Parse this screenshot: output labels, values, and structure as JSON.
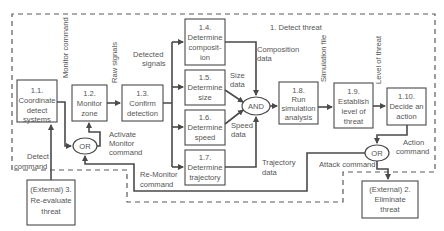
{
  "boundary": {
    "label": "1. Detect threat"
  },
  "processes": [
    {
      "id": "1.1.",
      "lines": [
        "1.1.",
        "Coordinate",
        "detect",
        "systems"
      ]
    },
    {
      "id": "1.2.",
      "lines": [
        "1.2.",
        "Monitor",
        "zone"
      ]
    },
    {
      "id": "1.3.",
      "lines": [
        "1.3.",
        "Confirm",
        "detection"
      ]
    },
    {
      "id": "1.4.",
      "lines": [
        "1.4.",
        "Determine",
        "composit-",
        "ion"
      ]
    },
    {
      "id": "1.5.",
      "lines": [
        "1.5.",
        "Determine",
        "size"
      ]
    },
    {
      "id": "1.6.",
      "lines": [
        "1.6.",
        "Determine",
        "speed"
      ]
    },
    {
      "id": "1.7.",
      "lines": [
        "1.7.",
        "Determine",
        "trajectory"
      ]
    },
    {
      "id": "1.8.",
      "lines": [
        "1.8.",
        "Run",
        "simulation",
        "analysis"
      ]
    },
    {
      "id": "1.9.",
      "lines": [
        "1.9.",
        "Establish",
        "level of",
        "threat"
      ]
    },
    {
      "id": "1.10.",
      "lines": [
        "1.10.",
        "Decide an",
        "action"
      ]
    }
  ],
  "externals": [
    {
      "id": "ext3",
      "lines": [
        "(External) 3.",
        "Re-evaluate",
        "threat"
      ]
    },
    {
      "id": "ext2",
      "lines": [
        "(External) 2.",
        "Eliminate",
        "threat"
      ]
    }
  ],
  "gates": {
    "and": "AND",
    "or_left": "OR",
    "or_right": "OR"
  },
  "flows": {
    "monitor_command": "Monitor command",
    "raw_signals": "Raw signals",
    "detected_signals": [
      "Detected",
      "signals"
    ],
    "composition_data": [
      "Composition",
      "data"
    ],
    "size_data": [
      "Size",
      "data"
    ],
    "speed_data": [
      "Speed",
      "data"
    ],
    "trajectory_data": [
      "Trajectory",
      "data"
    ],
    "simulation_file": "Simulation file",
    "level_of_threat": "Level of threat",
    "activate_monitor_command": [
      "Activate",
      "Monitor",
      "command"
    ],
    "re_monitor_command": [
      "Re-Monitor",
      "command"
    ],
    "detect_command": [
      "Detect",
      "command"
    ],
    "action_command": [
      "Action",
      "command"
    ],
    "attack_command": "Attack command"
  }
}
